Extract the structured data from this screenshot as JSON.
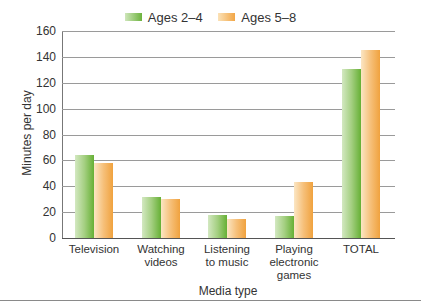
{
  "chart_data": {
    "type": "bar",
    "title": "",
    "categories": [
      "Television",
      "Watching videos",
      "Listening to music",
      "Playing electronic games",
      "TOTAL"
    ],
    "category_lines": [
      [
        "Television"
      ],
      [
        "Watching",
        "videos"
      ],
      [
        "Listening",
        "to music"
      ],
      [
        "Playing",
        "electronic",
        "games"
      ],
      [
        "TOTAL"
      ]
    ],
    "series": [
      {
        "name": "Ages 2–4",
        "color": "#6cb33d",
        "values": [
          64,
          32,
          18,
          17,
          131
        ]
      },
      {
        "name": "Ages 5–8",
        "color": "#f2a646",
        "values": [
          58,
          30,
          15,
          43,
          145
        ]
      }
    ],
    "xlabel": "Media type",
    "ylabel": "Minutes per day",
    "ylim": [
      0,
      160
    ],
    "yticks": [
      0,
      20,
      40,
      60,
      80,
      100,
      120,
      140,
      160
    ],
    "grid": true,
    "legend_position": "top"
  },
  "legend": {
    "items": [
      {
        "label": "Ages 2–4"
      },
      {
        "label": "Ages 5–8"
      }
    ]
  }
}
